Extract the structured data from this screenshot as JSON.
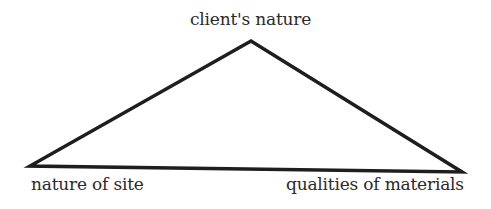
{
  "diagram": {
    "type": "triangle",
    "labels": {
      "top": "client's nature",
      "bottom_left": "nature of site",
      "bottom_right": "qualities of materials"
    },
    "vertices": {
      "top": [
        251,
        41
      ],
      "bottom_left": [
        30,
        166
      ],
      "bottom_right": [
        462,
        172
      ]
    },
    "colors": {
      "line": "#1e1e1e",
      "text": "#2a2a2a",
      "background": "#ffffff"
    }
  }
}
